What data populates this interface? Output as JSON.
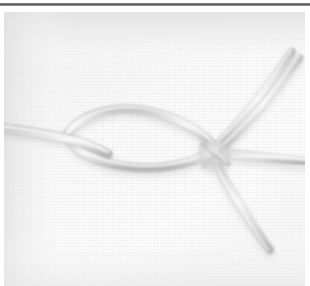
{
  "scene": {
    "title": "Knotted rope on white fabric",
    "subject": "rope-knot",
    "background_label": "white woven fabric backdrop",
    "orientation": "landscape"
  },
  "frame": {
    "top_rule_color": "#5c5c5c",
    "page_background": "#ffffff",
    "photo_left": 4,
    "photo_top": 12,
    "photo_width": 301,
    "photo_height": 274
  },
  "colors": {
    "background_light": "#fdfdfd",
    "background_mid": "#f4f4f4",
    "background_shadow": "#e6e6e6",
    "vignette_corner": "#e2e2e2",
    "rope_core": "#e9e9e9",
    "rope_edge": "#bdbdbd",
    "rope_shadow": "#a9a9a9",
    "rope_highlight": "#fafafa",
    "knot_shadow": "#b4b4b4"
  },
  "rope": {
    "label": "light gray cord",
    "stroke_width": 7,
    "parts": [
      {
        "name": "standing-part-left",
        "label": "standing part entering from left edge",
        "path": "M -6 116 C 18 118, 40 122, 60 126 C 78 130, 92 136, 104 142"
      },
      {
        "name": "loop-upper-arc",
        "label": "upper arc of the bight loop",
        "path": "M 62 124 C 74 104, 104 94, 136 98 C 168 102, 196 118, 208 132"
      },
      {
        "name": "loop-lower-arc",
        "label": "lower arc of the bight loop",
        "path": "M 66 128 C 74 140, 92 150, 118 154 C 152 160, 188 152, 208 140"
      },
      {
        "name": "standing-part-right",
        "label": "standing part exiting to right edge",
        "path": "M 206 140 C 232 142, 266 146, 306 150"
      },
      {
        "name": "tail-upper-right",
        "label": "working end running up to the top-right",
        "path": "M 208 138 C 232 116, 262 78, 288 40"
      },
      {
        "name": "tail-upper-right-second",
        "label": "second strand running up to the top-right",
        "path": "M 212 142 C 238 120, 266 84, 296 46"
      },
      {
        "name": "tail-lower-right",
        "label": "working end running down to the lower-right",
        "path": "M 210 146 C 222 172, 242 204, 266 238"
      }
    ],
    "knot": {
      "name": "central-knot",
      "label": "crossing knot where strands bind",
      "center_x": 210,
      "center_y": 142,
      "radius_x": 16,
      "radius_y": 13
    }
  }
}
